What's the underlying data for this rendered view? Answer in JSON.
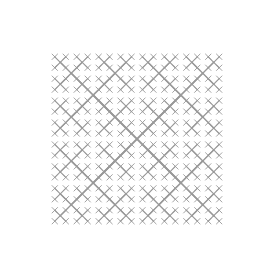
{
  "window": {
    "title": "Fractal Canvas",
    "width": 269,
    "height": 272,
    "background_color": "#ffffff"
  },
  "header": {
    "title": "Fractal Canvas",
    "title_color": "#3a3a3a",
    "clipped_by_viewport_top": true
  },
  "figure": {
    "name": "recursive-cross-fractal",
    "stroke_color": "#999999",
    "background_color": "#ffffff",
    "center_x": 137,
    "center_y": 139,
    "arm_length": 62,
    "depth": 5,
    "scale_factor": 0.5,
    "stroke_width_base": 2.0,
    "stroke_width_min": 0.9,
    "bounds": {
      "left": 12,
      "top": 13,
      "right": 262,
      "bottom": 265
    },
    "arm_angles_degrees": [
      45,
      135,
      225,
      315
    ]
  },
  "chart_data": {
    "type": "scatter",
    "title": "Fractal Canvas",
    "xlabel": "",
    "ylabel": "",
    "grid": false,
    "legend_position": "none",
    "xlim": [
      0,
      269
    ],
    "ylim": [
      0,
      272
    ],
    "series": [
      {
        "name": "recursive-cross-fractal",
        "color": "#999999",
        "generator": "X-branch",
        "depth": 5,
        "scale_factor": 0.5,
        "root_center": [
          137,
          139
        ],
        "root_arm_length": 62,
        "branch_angles_degrees": [
          45,
          135,
          225,
          315
        ],
        "level_centers": {
          "level_0": [
            [
              137,
              139
            ]
          ],
          "level_1": [
            [
              93,
              95
            ],
            [
              181,
              95
            ],
            [
              93,
              183
            ],
            [
              181,
              183
            ]
          ],
          "level_2_example": [
            [
              59,
              61
            ],
            [
              215,
              61
            ],
            [
              59,
              217
            ],
            [
              215,
              217
            ]
          ]
        },
        "node_count_by_level": [
          1,
          4,
          16,
          64,
          256
        ]
      }
    ]
  }
}
